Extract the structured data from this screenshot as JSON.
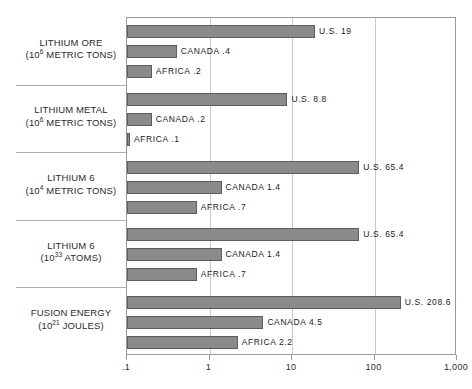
{
  "chart_data": {
    "type": "bar",
    "orientation": "horizontal",
    "title": "",
    "xlabel": "",
    "ylabel": "",
    "xscale": "log",
    "xlim": [
      0.1,
      1000
    ],
    "grid": true,
    "legend": "none",
    "tick_labels": [
      ".1",
      "1",
      "10",
      "100",
      "1,000"
    ],
    "tick_values": [
      0.1,
      1,
      10,
      100,
      1000
    ],
    "series": [
      {
        "name": "U.S."
      },
      {
        "name": "CANADA"
      },
      {
        "name": "AFRICA"
      }
    ],
    "groups": [
      {
        "category": "LITHIUM ORE",
        "unit_base": "(10",
        "unit_exp": "6",
        "unit_tail": " METRIC TONS)",
        "bars": [
          {
            "label": "U.S. 19",
            "series": "U.S.",
            "value": 19
          },
          {
            "label": "CANADA .4",
            "series": "CANADA",
            "value": 0.4
          },
          {
            "label": "AFRICA .2",
            "series": "AFRICA",
            "value": 0.2
          }
        ]
      },
      {
        "category": "LITHIUM METAL",
        "unit_base": "(10",
        "unit_exp": "6",
        "unit_tail": " METRIC TONS)",
        "bars": [
          {
            "label": "U.S. 8.8",
            "series": "U.S.",
            "value": 8.8
          },
          {
            "label": "CANADA .2",
            "series": "CANADA",
            "value": 0.2
          },
          {
            "label": "AFRICA .1",
            "series": "AFRICA",
            "value": 0.1
          }
        ]
      },
      {
        "category": "LITHIUM 6",
        "unit_base": "(10",
        "unit_exp": "4",
        "unit_tail": " METRIC TONS)",
        "bars": [
          {
            "label": "U.S. 65.4",
            "series": "U.S.",
            "value": 65.4
          },
          {
            "label": "CANADA 1.4",
            "series": "CANADA",
            "value": 1.4
          },
          {
            "label": "AFRICA .7",
            "series": "AFRICA",
            "value": 0.7
          }
        ]
      },
      {
        "category": "LITHIUM 6",
        "unit_base": "(10",
        "unit_exp": "33",
        "unit_tail": " ATOMS)",
        "bars": [
          {
            "label": "U.S. 65.4",
            "series": "U.S.",
            "value": 65.4
          },
          {
            "label": "CANADA 1.4",
            "series": "CANADA",
            "value": 1.4
          },
          {
            "label": "AFRICA .7",
            "series": "AFRICA",
            "value": 0.7
          }
        ]
      },
      {
        "category": "FUSION ENERGY",
        "unit_base": "(10",
        "unit_exp": "21",
        "unit_tail": " JOULES)",
        "bars": [
          {
            "label": "U.S. 208.6",
            "series": "U.S.",
            "value": 208.6
          },
          {
            "label": "CANADA 4.5",
            "series": "CANADA",
            "value": 4.5
          },
          {
            "label": "AFRICA 2.2",
            "series": "AFRICA",
            "value": 2.2
          }
        ]
      }
    ],
    "colors": {
      "bar_fill": "#8a8a8a",
      "bar_stroke": "#5d5d5d",
      "frame": "#9a9a9a",
      "grid": "#c9c9c9",
      "text": "#1a1a1a"
    }
  }
}
